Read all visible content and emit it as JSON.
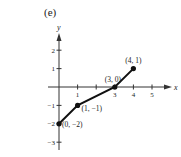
{
  "panel_label": "(e)",
  "chart_data": {
    "type": "line",
    "title": "",
    "xlabel": "x",
    "ylabel": "y",
    "xlim": [
      0,
      5
    ],
    "ylim": [
      -3,
      2
    ],
    "x_ticks": [
      1,
      2,
      3,
      4,
      5
    ],
    "x_tick_labels": [
      "1",
      "",
      "3",
      "4",
      "5"
    ],
    "y_ticks": [
      2,
      1,
      -1,
      -2,
      -3
    ],
    "y_tick_labels": [
      "2",
      "1",
      "-1",
      "-2",
      "-3"
    ],
    "grid": false,
    "series": [
      {
        "name": "piecewise",
        "points": [
          {
            "x": 0,
            "y": -2,
            "label": "(0, −2)"
          },
          {
            "x": 1,
            "y": -1,
            "label": "(1, −1)"
          },
          {
            "x": 3,
            "y": 0,
            "label": "(3, 0)"
          },
          {
            "x": 4,
            "y": 1,
            "label": "(4, 1)"
          }
        ]
      }
    ]
  }
}
